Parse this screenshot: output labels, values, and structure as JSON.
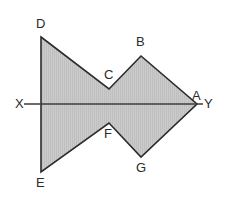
{
  "figure": {
    "title": "",
    "canvas": {
      "width": 231,
      "height": 203,
      "background": "#ffffff"
    },
    "style": {
      "fill_color": "#c9c9c9",
      "hatch_color": "#b5b5b5",
      "stroke_color": "#2b2b2b",
      "axis_color": "#3d3d3d",
      "label_color": "#2b2b2b",
      "stroke_width": 1.6,
      "axis_width": 1.6
    },
    "axis": {
      "name": "line-XY",
      "start_label": "X",
      "end_label": "Y",
      "x1": 24,
      "y1": 104,
      "x2": 203,
      "y2": 104
    },
    "polygon": {
      "name": "arrow-polygon-DCBAGFE",
      "vertex_order": [
        "D",
        "C",
        "B",
        "A",
        "G",
        "F",
        "E"
      ],
      "points": "41,37 109,89 141,56 197,104 141,157 109,123 41,172"
    },
    "vertices": [
      {
        "id": "D",
        "label": "D",
        "x": 41,
        "y": 37,
        "label_x": 36,
        "label_y": 17
      },
      {
        "id": "C",
        "label": "C",
        "x": 109,
        "y": 89,
        "label_x": 104,
        "label_y": 68
      },
      {
        "id": "B",
        "label": "B",
        "x": 141,
        "y": 56,
        "label_x": 136,
        "label_y": 35
      },
      {
        "id": "A",
        "label": "A",
        "x": 197,
        "y": 104,
        "label_x": 192,
        "label_y": 89
      },
      {
        "id": "G",
        "label": "G",
        "x": 141,
        "y": 157,
        "label_x": 136,
        "label_y": 161
      },
      {
        "id": "F",
        "label": "F",
        "x": 109,
        "y": 123,
        "label_x": 104,
        "label_y": 127
      },
      {
        "id": "E",
        "label": "E",
        "x": 41,
        "y": 172,
        "label_x": 36,
        "label_y": 176
      }
    ],
    "axis_labels": [
      {
        "id": "X",
        "label": "X",
        "label_x": 15,
        "label_y": 97
      },
      {
        "id": "Y",
        "label": "Y",
        "label_x": 204,
        "label_y": 97
      }
    ]
  }
}
